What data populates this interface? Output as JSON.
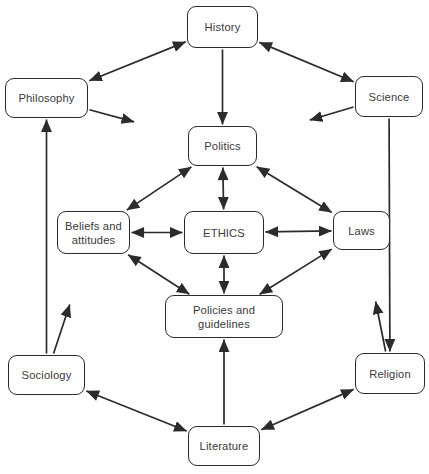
{
  "diagram": {
    "type": "concept-map",
    "title": "",
    "canvas": {
      "width": 429,
      "height": 474,
      "background": "#ffffff"
    },
    "style": {
      "node_border_color": "#2b2b2b",
      "node_fill_color": "#ffffff",
      "node_text_color": "#3a3a3a",
      "edge_color": "#2b2b2b"
    },
    "nodes": [
      {
        "id": "history",
        "label": "History",
        "x": 187,
        "y": 6,
        "w": 71,
        "h": 42
      },
      {
        "id": "philosophy",
        "label": "Philosophy",
        "x": 5,
        "y": 78,
        "w": 83,
        "h": 40
      },
      {
        "id": "science",
        "label": "Science",
        "x": 355,
        "y": 76,
        "w": 68,
        "h": 41
      },
      {
        "id": "politics",
        "label": "Politics",
        "x": 188,
        "y": 126,
        "w": 69,
        "h": 40
      },
      {
        "id": "beliefs",
        "label": "Beliefs and\nattitudes",
        "x": 57,
        "y": 211,
        "w": 73,
        "h": 43
      },
      {
        "id": "ethics",
        "label": "ETHICS",
        "x": 184,
        "y": 211,
        "w": 80,
        "h": 43
      },
      {
        "id": "laws",
        "label": "Laws",
        "x": 333,
        "y": 211,
        "w": 57,
        "h": 39
      },
      {
        "id": "policies",
        "label": "Policies and\nguidelines",
        "x": 165,
        "y": 295,
        "w": 118,
        "h": 43
      },
      {
        "id": "sociology",
        "label": "Sociology",
        "x": 8,
        "y": 355,
        "w": 77,
        "h": 40
      },
      {
        "id": "religion",
        "label": "Religion",
        "x": 355,
        "y": 353,
        "w": 70,
        "h": 41
      },
      {
        "id": "literature",
        "label": "Literature",
        "x": 188,
        "y": 426,
        "w": 72,
        "h": 40
      }
    ],
    "edges": [
      {
        "id": "history-philosophy",
        "from": "history",
        "to": "philosophy",
        "arrows": "both"
      },
      {
        "id": "history-science",
        "from": "history",
        "to": "science",
        "arrows": "both"
      },
      {
        "id": "history-politics",
        "from": "history",
        "to": "politics",
        "arrows": "forward"
      },
      {
        "id": "philosophy-center",
        "from": "philosophy",
        "to": "politics",
        "arrows": "forward"
      },
      {
        "id": "science-center",
        "from": "science",
        "to": "politics",
        "arrows": "forward"
      },
      {
        "id": "beliefs-politics",
        "from": "beliefs",
        "to": "politics",
        "arrows": "both"
      },
      {
        "id": "politics-laws",
        "from": "politics",
        "to": "laws",
        "arrows": "both"
      },
      {
        "id": "politics-ethics",
        "from": "politics",
        "to": "ethics",
        "arrows": "both"
      },
      {
        "id": "beliefs-ethics",
        "from": "beliefs",
        "to": "ethics",
        "arrows": "both"
      },
      {
        "id": "ethics-laws",
        "from": "ethics",
        "to": "laws",
        "arrows": "both"
      },
      {
        "id": "ethics-policies",
        "from": "ethics",
        "to": "policies",
        "arrows": "both"
      },
      {
        "id": "beliefs-policies",
        "from": "beliefs",
        "to": "policies",
        "arrows": "both"
      },
      {
        "id": "policies-laws",
        "from": "policies",
        "to": "laws",
        "arrows": "both"
      },
      {
        "id": "sociology-beliefs",
        "from": "sociology",
        "to": "beliefs",
        "arrows": "forward"
      },
      {
        "id": "religion-laws",
        "from": "religion",
        "to": "laws",
        "arrows": "forward"
      },
      {
        "id": "sociology-philosophy",
        "from": "sociology",
        "to": "philosophy",
        "arrows": "forward"
      },
      {
        "id": "science-religion",
        "from": "science",
        "to": "religion",
        "arrows": "forward"
      },
      {
        "id": "literature-policies",
        "from": "literature",
        "to": "policies",
        "arrows": "forward"
      },
      {
        "id": "sociology-literature",
        "from": "sociology",
        "to": "literature",
        "arrows": "both"
      },
      {
        "id": "literature-religion",
        "from": "literature",
        "to": "religion",
        "arrows": "both"
      }
    ]
  }
}
